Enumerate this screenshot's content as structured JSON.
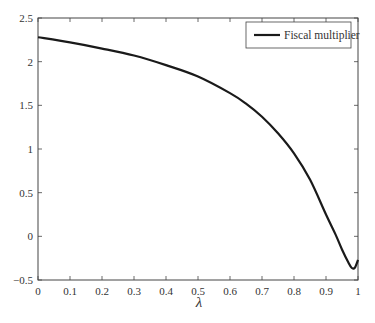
{
  "chart_data": {
    "type": "line",
    "title": "",
    "xlabel": "λ",
    "ylabel": "",
    "xlim": [
      0,
      1
    ],
    "ylim": [
      -0.5,
      2.5
    ],
    "xticks": [
      0,
      0.1,
      0.2,
      0.3,
      0.4,
      0.5,
      0.6,
      0.7,
      0.8,
      0.9,
      1
    ],
    "xtick_labels": [
      "0",
      "0.1",
      "0.2",
      "0.3",
      "0.4",
      "0.5",
      "0.6",
      "0.7",
      "0.8",
      "0.9",
      "1"
    ],
    "yticks": [
      -0.5,
      0,
      0.5,
      1,
      1.5,
      2,
      2.5
    ],
    "ytick_labels": [
      "−0.5",
      "0",
      "0.5",
      "1",
      "1.5",
      "2",
      "2.5"
    ],
    "grid": false,
    "legend_position": "upper right",
    "series": [
      {
        "name": "Fiscal multiplier",
        "color": "#1a1a1a",
        "x": [
          0,
          0.1,
          0.2,
          0.3,
          0.4,
          0.5,
          0.6,
          0.65,
          0.7,
          0.75,
          0.8,
          0.85,
          0.9,
          0.93,
          0.95,
          0.97,
          0.98,
          0.99,
          1.0
        ],
        "y": [
          2.28,
          2.22,
          2.15,
          2.07,
          1.96,
          1.83,
          1.64,
          1.52,
          1.37,
          1.18,
          0.95,
          0.65,
          0.25,
          0.02,
          -0.15,
          -0.3,
          -0.36,
          -0.36,
          -0.27
        ]
      }
    ]
  }
}
